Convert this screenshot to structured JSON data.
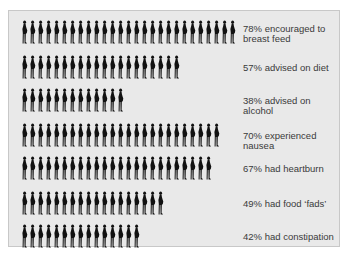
{
  "chart_data": {
    "type": "pictogram",
    "title": "",
    "unit_icon": "pregnant-woman-silhouette",
    "categories": [
      "encouraged to breast feed",
      "advised on diet",
      "advised on alcohol",
      "experienced nausea",
      "had heartburn",
      "had food \"fads\"",
      "had constipation"
    ],
    "values": [
      78,
      57,
      38,
      70,
      67,
      49,
      42
    ],
    "icon_counts": [
      27,
      20,
      13,
      25,
      24,
      18,
      15
    ],
    "labels": [
      "78% encouraged to breast feed",
      "57% advised on diet",
      "38% advised on alcohol",
      "70% experienced nausea",
      "67% had heartburn",
      "49% had food ‘fads’",
      "42% had constipation"
    ],
    "value_unit": "%"
  },
  "colors": {
    "panel": "#e9e9e9",
    "border": "#c8c8c8",
    "icon": "#111111",
    "text": "#3a3a3a"
  }
}
